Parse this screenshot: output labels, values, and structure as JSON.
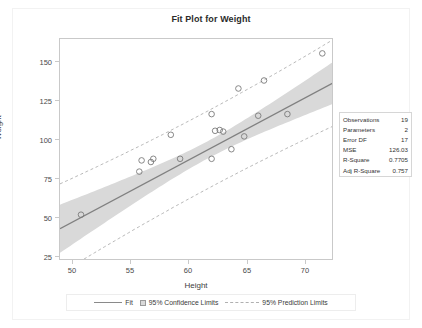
{
  "chart_data": {
    "type": "scatter",
    "title": "Fit Plot for Weight",
    "xlabel": "Height",
    "ylabel": "Weight",
    "xlim": [
      49.5,
      73.0
    ],
    "ylim": [
      21,
      160
    ],
    "xticks": [
      50,
      55,
      60,
      65,
      70
    ],
    "yticks": [
      25,
      50,
      75,
      100,
      125,
      150
    ],
    "grid": false,
    "legend_position": "bottom",
    "x": [
      51.3,
      56.3,
      56.5,
      57.3,
      57.5,
      59.0,
      59.8,
      62.5,
      62.5,
      62.8,
      63.2,
      63.5,
      64.2,
      64.8,
      65.3,
      66.5,
      67.0,
      69.0,
      72.0
    ],
    "y": [
      50,
      77,
      84,
      83,
      85,
      100,
      85,
      113,
      85,
      102.5,
      103,
      102,
      91,
      129,
      99,
      112,
      134,
      113,
      151
    ],
    "series": [
      {
        "name": "Fit",
        "type": "line",
        "slope": 3.899,
        "intercept": -151.8,
        "color": "#808080"
      },
      {
        "name": "95% Confidence Limits",
        "type": "band",
        "color": "#d9d9d9"
      },
      {
        "name": "95% Prediction Limits",
        "type": "dashed-band",
        "color": "#b0b0b0"
      }
    ],
    "marker": {
      "shape": "open-circle",
      "color": "#7a7a7a",
      "size": 4
    }
  },
  "stats": {
    "rows": [
      {
        "label": "Observations",
        "value": "19"
      },
      {
        "label": "Parameters",
        "value": "2"
      },
      {
        "label": "Error DF",
        "value": "17"
      },
      {
        "label": "MSE",
        "value": "126.03"
      },
      {
        "label": "R-Square",
        "value": "0.7705"
      },
      {
        "label": "Adj R-Square",
        "value": "0.757"
      }
    ]
  },
  "legend": {
    "fit": "Fit",
    "confidence": "95% Confidence Limits",
    "prediction": "95% Prediction Limits"
  },
  "axes": {
    "y_tick_labels": [
      "150",
      "125",
      "100",
      "75",
      "50",
      "25"
    ],
    "x_tick_labels": [
      "50",
      "55",
      "60",
      "65",
      "70"
    ]
  },
  "colors": {
    "fit_line": "#808080",
    "confidence_band": "#d9d9d9",
    "prediction_line": "#b0b0b0",
    "marker": "#7a7a7a",
    "frame": "#c9c9c9"
  }
}
